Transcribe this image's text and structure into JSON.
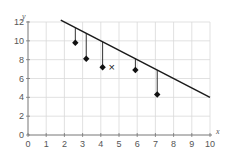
{
  "chart_data": {
    "type": "scatter",
    "title": "",
    "xlabel": "x",
    "ylabel": "y",
    "xlim": [
      0,
      10
    ],
    "ylim": [
      0,
      12
    ],
    "x_ticks": [
      0,
      1,
      2,
      3,
      4,
      5,
      6,
      7,
      8,
      9,
      10
    ],
    "y_ticks": [
      0,
      2,
      4,
      6,
      8,
      10,
      12
    ],
    "grid": true,
    "series": [
      {
        "name": "data points",
        "marker": "diamond",
        "points": [
          {
            "x": 2.6,
            "y": 9.8
          },
          {
            "x": 3.2,
            "y": 8.1
          },
          {
            "x": 4.1,
            "y": 7.2
          },
          {
            "x": 5.9,
            "y": 6.9
          },
          {
            "x": 7.1,
            "y": 4.3
          }
        ]
      },
      {
        "name": "marked point",
        "marker": "x",
        "points": [
          {
            "x": 4.6,
            "y": 7.2
          }
        ]
      }
    ],
    "line": {
      "x1": 1.8,
      "y1": 12.2,
      "x2": 10,
      "y2": 4.0
    },
    "residuals": "vertical segments from each data point up to the line",
    "annotations": [
      "×"
    ]
  },
  "axes": {
    "x_label": "x",
    "y_label": "y",
    "marker_x_symbol": "×"
  }
}
